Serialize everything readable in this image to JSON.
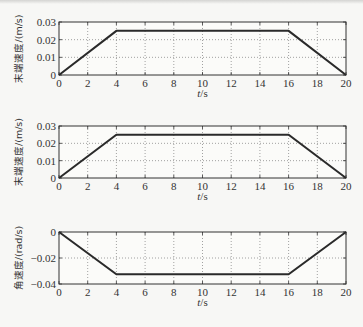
{
  "chart_data": [
    {
      "type": "line",
      "title": "",
      "xlabel": "t/s",
      "ylabel": "末端速度/(m/s)",
      "xlim": [
        0,
        20
      ],
      "ylim": [
        0,
        0.03
      ],
      "xticks": [
        0,
        2,
        4,
        6,
        8,
        10,
        12,
        14,
        16,
        18,
        20
      ],
      "yticks": [
        0,
        0.01,
        0.02,
        0.03
      ],
      "ytick_labels": [
        "0",
        "0.01",
        "0.02",
        "0.03"
      ],
      "grid": true,
      "series": [
        {
          "name": "末端速度",
          "x": [
            0,
            4,
            16,
            20
          ],
          "y": [
            0,
            0.025,
            0.025,
            0
          ]
        }
      ]
    },
    {
      "type": "line",
      "title": "",
      "xlabel": "t/s",
      "ylabel": "末端速度/(m/s)",
      "xlim": [
        0,
        20
      ],
      "ylim": [
        0,
        0.03
      ],
      "xticks": [
        0,
        2,
        4,
        6,
        8,
        10,
        12,
        14,
        16,
        18,
        20
      ],
      "yticks": [
        0,
        0.01,
        0.02,
        0.03
      ],
      "ytick_labels": [
        "0",
        "0.01",
        "0.02",
        "0.03"
      ],
      "grid": true,
      "series": [
        {
          "name": "末端速度",
          "x": [
            0,
            4,
            16,
            20
          ],
          "y": [
            0,
            0.025,
            0.025,
            0
          ]
        }
      ]
    },
    {
      "type": "line",
      "title": "",
      "xlabel": "t/s",
      "ylabel": "角速度/(rad/s)",
      "xlim": [
        0,
        20
      ],
      "ylim": [
        -0.04,
        0
      ],
      "xticks": [
        0,
        2,
        4,
        6,
        8,
        10,
        12,
        14,
        16,
        18,
        20
      ],
      "yticks": [
        -0.04,
        -0.02,
        0
      ],
      "ytick_labels": [
        "-0.04",
        "-0.02",
        "0"
      ],
      "grid": true,
      "series": [
        {
          "name": "角速度",
          "x": [
            0,
            4,
            16,
            20
          ],
          "y": [
            0,
            -0.0325,
            -0.0325,
            0
          ]
        }
      ]
    }
  ],
  "labels": {
    "plot1_ylabel": "末端速度/(m/s)",
    "plot2_ylabel": "末端速度/(m/s)",
    "plot3_ylabel": "角速度/(rad/s)",
    "xlabel": "t/s"
  }
}
